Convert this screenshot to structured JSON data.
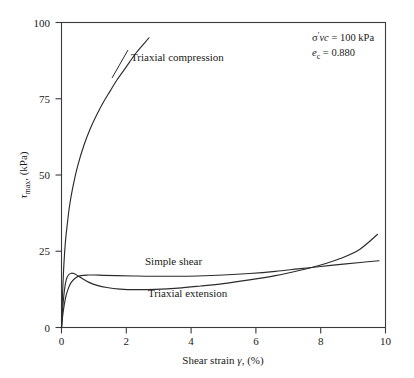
{
  "figure": {
    "background_color": "#ffffff",
    "line_color": "#2b2b2b",
    "axis_color": "#3a3a3a"
  },
  "annotation": {
    "line1_sigma": "σ",
    "line1_prime": "′",
    "line1_vc": "vc",
    "line1_rest": " = 100 kPa",
    "line1_full": "σ′vc = 100 kPa",
    "line2_e": "e",
    "line2_sub": "c",
    "line2_rest": " = 0.880",
    "line2_full": "eᶜ = 0.880"
  },
  "axes": {
    "x_title_main": "Shear strain ",
    "x_title_gamma": "γ",
    "x_title_unit": ", (%)",
    "x_title_full": "Shear strain γ, (%)",
    "y_title_tau": "τ",
    "y_title_sub": "max",
    "y_title_unit": ", (kPa)",
    "y_title_full": "τmax, (kPa)",
    "x_ticks": [
      "0",
      "2",
      "4",
      "6",
      "8",
      "10"
    ],
    "y_ticks": [
      "0",
      "25",
      "50",
      "75",
      "100"
    ]
  },
  "labels": {
    "triaxial_compression": "Triaxial compression",
    "simple_shear": "Simple shear",
    "triaxial_extension": "Triaxial extension"
  },
  "chart_data": {
    "type": "line",
    "title": "",
    "xlabel": "Shear strain γ, (%)",
    "ylabel": "τmax, (kPa)",
    "xlim": [
      0,
      10
    ],
    "ylim": [
      0,
      100
    ],
    "xticks": [
      0,
      2,
      4,
      6,
      8,
      10
    ],
    "yticks": [
      0,
      25,
      50,
      75,
      100
    ],
    "grid": false,
    "legend": "inline-curve-labels",
    "annotations": [
      "σ′vc = 100 kPa",
      "e_c = 0.880"
    ],
    "series": [
      {
        "name": "Triaxial compression",
        "label_position": {
          "x": 1.5,
          "y": 86
        },
        "x": [
          0,
          0.03,
          0.07,
          0.12,
          0.18,
          0.25,
          0.35,
          0.5,
          0.7,
          0.9,
          1.1,
          1.3,
          1.5,
          1.7,
          1.9,
          2.1,
          2.3,
          2.5,
          2.7
        ],
        "y": [
          0,
          10,
          20,
          28,
          34,
          40,
          46,
          53,
          60,
          65.5,
          70,
          74,
          77.5,
          81,
          84,
          87,
          90,
          92.5,
          95
        ]
      },
      {
        "name": "Simple shear",
        "label_position": {
          "x": 3.6,
          "y": 20.5
        },
        "x": [
          0,
          0.05,
          0.12,
          0.2,
          0.3,
          0.45,
          0.6,
          0.8,
          1.0,
          1.3,
          1.7,
          2.2,
          2.8,
          3.5,
          4.2,
          5.0,
          5.8,
          6.6,
          7.3,
          8.0,
          8.7,
          9.3,
          9.8
        ],
        "y": [
          0,
          5.0,
          9.5,
          12.5,
          14.8,
          16.4,
          17.0,
          17.2,
          17.2,
          17.1,
          17.0,
          16.9,
          16.8,
          16.8,
          16.9,
          17.2,
          17.7,
          18.4,
          19.2,
          20.0,
          20.8,
          21.4,
          21.9
        ]
      },
      {
        "name": "Triaxial extension",
        "label_position": {
          "x": 3.4,
          "y": 11.0
        },
        "x": [
          0,
          0.05,
          0.1,
          0.15,
          0.22,
          0.3,
          0.38,
          0.5,
          0.65,
          0.85,
          1.1,
          1.4,
          1.8,
          2.3,
          2.9,
          3.6,
          4.3,
          5.0,
          5.8,
          6.6,
          7.3,
          8.0,
          8.6,
          9.2,
          9.75
        ],
        "y": [
          0,
          8.0,
          13.0,
          15.8,
          17.3,
          17.8,
          17.7,
          17.0,
          16.0,
          14.8,
          13.8,
          13.1,
          12.6,
          12.4,
          12.5,
          12.9,
          13.6,
          14.4,
          15.6,
          17.0,
          18.6,
          20.5,
          22.6,
          25.6,
          30.5
        ]
      }
    ]
  }
}
